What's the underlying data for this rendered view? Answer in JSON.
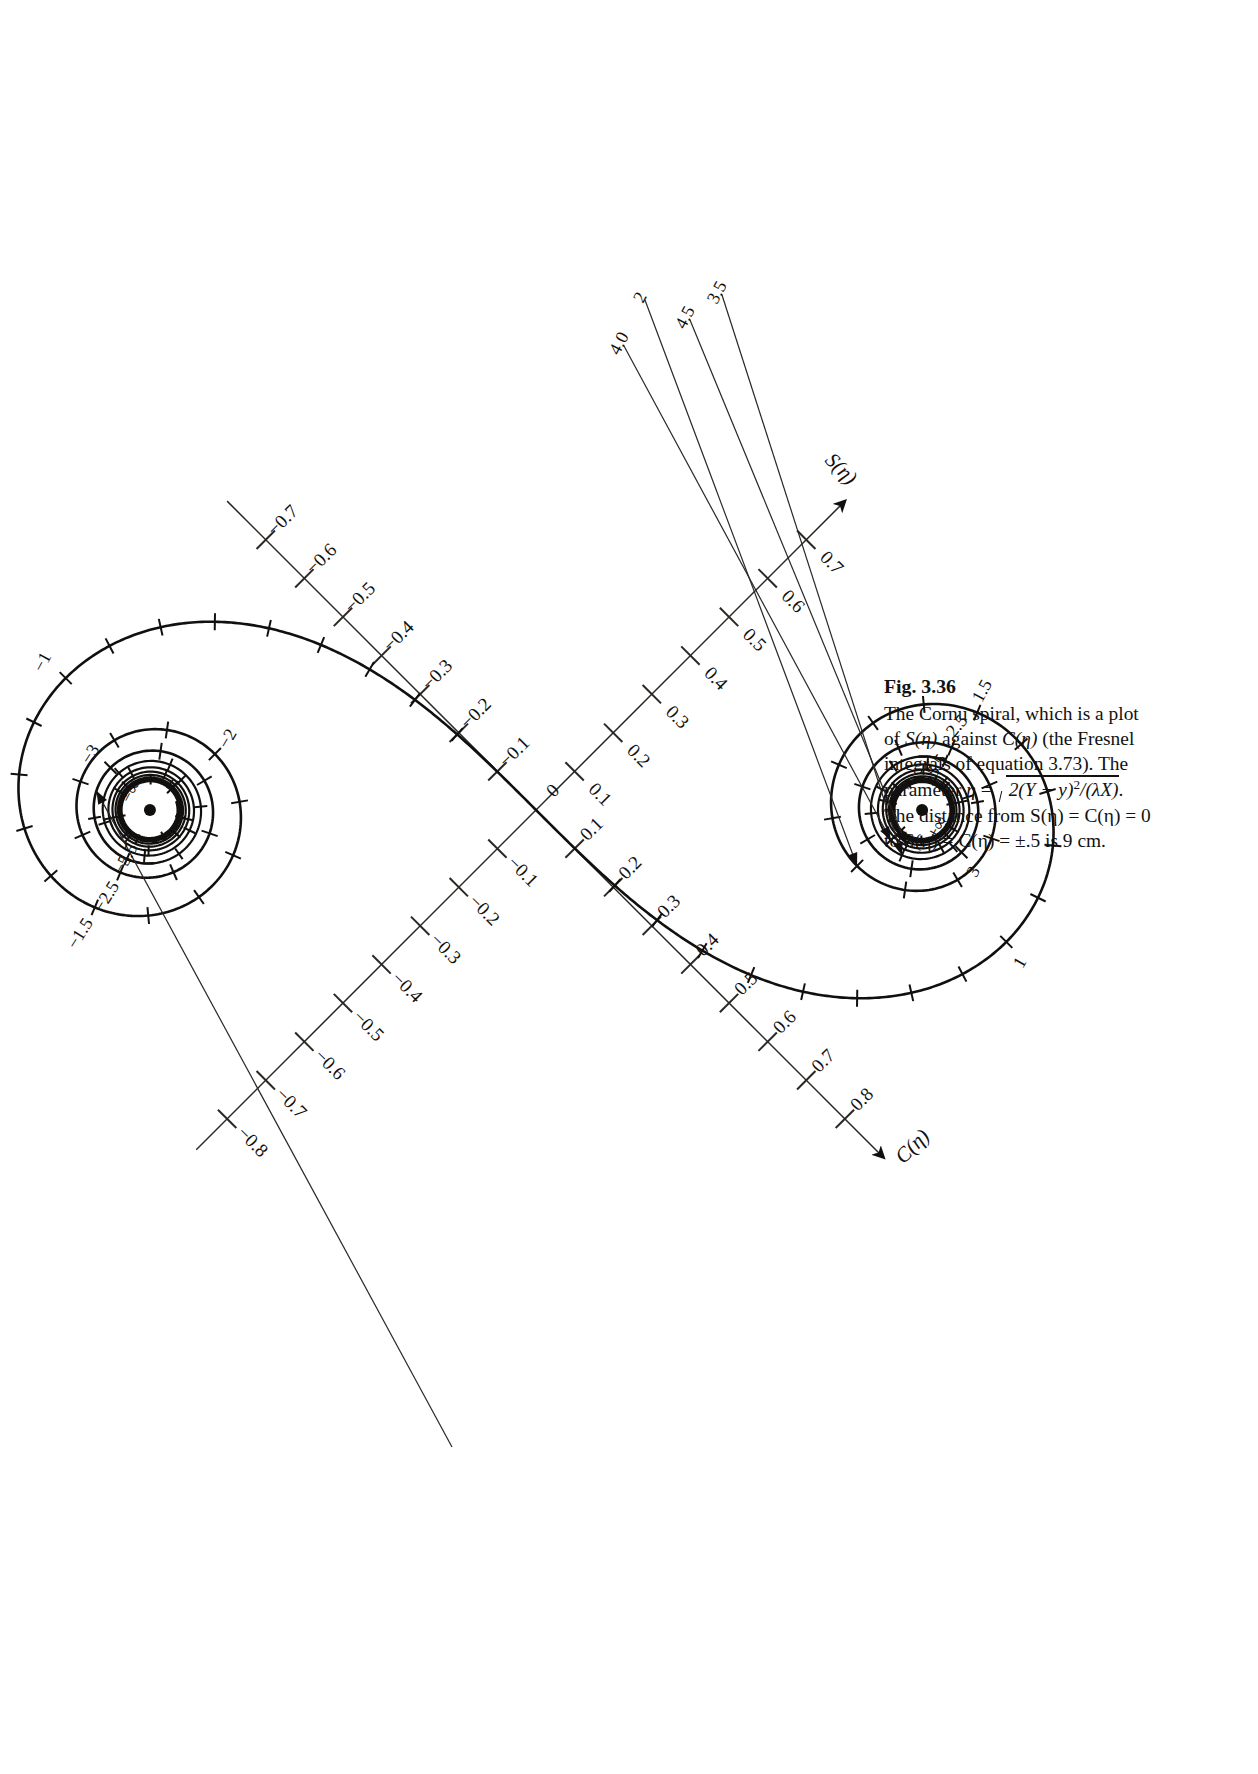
{
  "figure": {
    "number": "Fig. 3.36",
    "caption_line1": "The Cornu spiral, which is a plot",
    "caption_line2_a": "of ",
    "caption_line2_S": "S(η)",
    "caption_line2_b": " against ",
    "caption_line2_C": "C(η)",
    "caption_line2_c": " (the Fresnel",
    "caption_line3": "integrals of equation 3.73). The",
    "caption_line4_pre": "parameter ",
    "caption_line4_eta": "η",
    "caption_line4_eq": " = ",
    "caption_line4_radicand_a": "2(Y − y)",
    "caption_line4_radicand_exp": "2",
    "caption_line4_radicand_b": "/(λX)",
    "caption_line4_end": ".",
    "caption_line5": "The distance from S(η) = C(η) = 0",
    "caption_line6": "to S(η) = C(η) = ±.5 is 9 cm."
  },
  "chart_data": {
    "type": "line",
    "title": "The Cornu spiral",
    "xlabel": "C(η)",
    "ylabel": "S(η)",
    "parameter": "η",
    "xlim": [
      -0.9,
      0.9
    ],
    "ylim": [
      -0.9,
      0.9
    ],
    "grid": false,
    "legend": "none",
    "scale_note": "9 cm from origin to S=C=±.5",
    "axis_x": {
      "name": "C(η)",
      "ticks": [
        "-0.7",
        "-0.6",
        "-0.5",
        "-0.4",
        "-0.3",
        "-0.2",
        "-0.1",
        "0",
        "0.1",
        "0.2",
        "0.3",
        "0.4",
        "0.5",
        "0.6",
        "0.7",
        "0.8"
      ],
      "arrow": "positive-direction-upper-right"
    },
    "axis_y": {
      "name": "S(η)",
      "ticks": [
        "-0.8",
        "-0.7",
        "-0.6",
        "-0.5",
        "-0.4",
        "-0.3",
        "-0.2",
        "-0.1",
        "0.1",
        "0.2",
        "0.3",
        "0.4",
        "0.5",
        "0.6",
        "0.7"
      ],
      "arrow": "positive-direction-upper-left"
    },
    "eta_labels_upper": [
      "1",
      "1.5",
      "2",
      "2.5",
      "3",
      "3.5",
      "4.0",
      "4.5",
      "5.5",
      "+∞"
    ],
    "eta_labels_lower": [
      "-1",
      "-1.5",
      "-2",
      "-2.5",
      "-3",
      "-5.5",
      "-∞"
    ],
    "eta_tick_interval": 0.1,
    "converge_point_upper": "+∞",
    "converge_point_lower": "-∞",
    "series": [
      {
        "name": "Cornu spiral",
        "x_expr": "C(η)=∫0^η cos(πt²/2)dt",
        "y_expr": "S(η)=∫0^η sin(πt²/2)dt",
        "eta_range": [
          -6.0,
          6.0
        ]
      }
    ]
  },
  "labels": {
    "axis_y_name": "S(η)",
    "axis_x_name": "C(η)",
    "y_07": "0.7",
    "y_06": "0.6",
    "y_05": "0.5",
    "y_04": "0.4",
    "y_03": "0.3",
    "y_02": "0.2",
    "y_01": "0.1",
    "y_m01": "−0.1",
    "y_m02": "−0.2",
    "y_m03": "−0.3",
    "y_m04": "−0.4",
    "y_m05": "−0.5",
    "y_m06": "−0.6",
    "y_m07": "−0.7",
    "y_m08": "−0.8",
    "x_08": "0.8",
    "x_07": "0.7",
    "x_06": "0.6",
    "x_05": "0.5",
    "x_04": "0.4",
    "x_03": "0.3",
    "x_02": "0.2",
    "x_01": "0.1",
    "x_0": "0",
    "x_m01": "−0.1",
    "x_m02": "−0.2",
    "x_m03": "−0.3",
    "x_m04": "−0.4",
    "x_m05": "−0.5",
    "x_m06": "−0.6",
    "x_m07": "−0.7",
    "eta_1": "1",
    "eta_15": "1.5",
    "eta_2": "2",
    "eta_25": "2.5",
    "eta_3": "3",
    "eta_35": "3.5",
    "eta_40": "4.0",
    "eta_45": "4.5",
    "eta_55": "5.5",
    "eta_pinf": "+∞",
    "eta_m1": "−1",
    "eta_m15": "−1.5",
    "eta_m2": "−2",
    "eta_m25": "−2.5",
    "eta_m3": "−3",
    "eta_m55": "−5.5",
    "eta_minf": "−∞"
  }
}
